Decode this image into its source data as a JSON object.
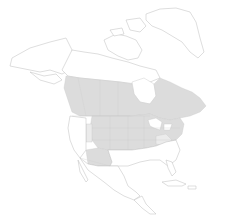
{
  "map": {
    "type": "range-map",
    "region": "North America",
    "colors": {
      "background": "#ffffff",
      "land": "#ffffff",
      "outline": "#bdbdbd",
      "range_primary": "#dcdcdc",
      "range_secondary": "#ebebeb"
    },
    "shaded_areas": [
      "Southern Canada (BC to Newfoundland)",
      "Northern Great Plains US",
      "Midwest US",
      "Northeast US",
      "Arizona / New Mexico",
      "Colorado / Kansas"
    ]
  }
}
